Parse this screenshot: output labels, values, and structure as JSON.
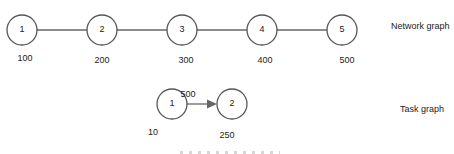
{
  "network_graph": {
    "title": "Network graph",
    "nodes": [
      {
        "id": "1",
        "value": "100"
      },
      {
        "id": "2",
        "value": "200"
      },
      {
        "id": "3",
        "value": "300"
      },
      {
        "id": "4",
        "value": "400"
      },
      {
        "id": "5",
        "value": "500"
      }
    ],
    "edges": [
      [
        "1",
        "2"
      ],
      [
        "2",
        "3"
      ],
      [
        "3",
        "4"
      ],
      [
        "4",
        "5"
      ]
    ]
  },
  "task_graph": {
    "title": "Task graph",
    "nodes": [
      {
        "id": "1",
        "value": "10"
      },
      {
        "id": "2",
        "value": "250"
      }
    ],
    "edges": [
      {
        "from": "1",
        "to": "2",
        "weight": "500"
      }
    ]
  },
  "colors": {
    "stroke": "#555555",
    "text": "#222222"
  }
}
